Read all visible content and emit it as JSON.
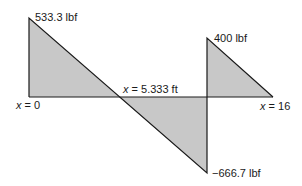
{
  "diagram": {
    "type": "shear-force-diagram",
    "fill_color": "#c8c8c8",
    "line_color": "#1a1a1a",
    "labels": {
      "peak_left": "533.3 lbf",
      "peak_right": "400 lbf",
      "min_value": "−666.7 lbf",
      "x_start_var": "x",
      "x_start_eq": " = 0",
      "x_zero_var": "x",
      "x_zero_eq": " = 5.333 ft",
      "x_end_var": "x",
      "x_end_eq": " = 16"
    },
    "points": [
      {
        "x": 0,
        "V": 533.3
      },
      {
        "x": 5.333,
        "V": 0
      },
      {
        "x": 12,
        "V": -666.7
      },
      {
        "x": 12,
        "V": 400
      },
      {
        "x": 16,
        "V": 0
      }
    ]
  }
}
